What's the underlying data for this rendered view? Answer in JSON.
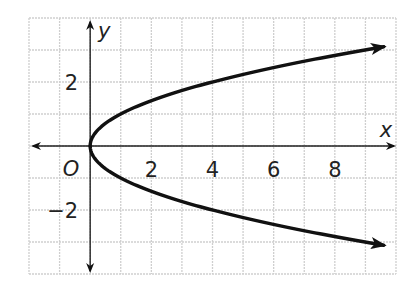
{
  "chart_data": {
    "type": "line",
    "title": "",
    "equation_hint": "x = y^2",
    "xlabel": "x",
    "ylabel": "y",
    "origin_label": "O",
    "xlim": [
      -2,
      10
    ],
    "ylim": [
      -4,
      4
    ],
    "grid": true,
    "x_ticks": [
      {
        "value": 2,
        "label": "2"
      },
      {
        "value": 4,
        "label": "4"
      },
      {
        "value": 6,
        "label": "6"
      },
      {
        "value": 8,
        "label": "8"
      }
    ],
    "y_ticks": [
      {
        "value": 2,
        "label": "2"
      },
      {
        "value": -2,
        "label": "−2"
      }
    ],
    "series": [
      {
        "name": "upper branch",
        "points": [
          [
            0,
            0
          ],
          [
            0.25,
            0.5
          ],
          [
            1,
            1
          ],
          [
            2.25,
            1.5
          ],
          [
            4,
            2
          ],
          [
            6.25,
            2.5
          ],
          [
            9,
            3
          ],
          [
            9.6,
            3.1
          ]
        ],
        "arrow_end": true
      },
      {
        "name": "lower branch",
        "points": [
          [
            0,
            0
          ],
          [
            0.25,
            -0.5
          ],
          [
            1,
            -1
          ],
          [
            2.25,
            -1.5
          ],
          [
            4,
            -2
          ],
          [
            6.25,
            -2.5
          ],
          [
            9,
            -3
          ],
          [
            9.6,
            -3.1
          ]
        ],
        "arrow_end": true
      }
    ]
  }
}
